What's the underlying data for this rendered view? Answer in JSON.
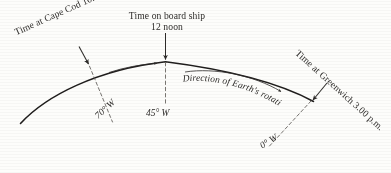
{
  "figure": {
    "type": "diagram",
    "background_color": "#fdfdfb",
    "ink_color": "#2d2b29"
  },
  "labels": {
    "cape_cod": {
      "line1": "Time at Cape Cod",
      "line2": "10.20 a.m.",
      "rotation_deg": -24
    },
    "on_board": {
      "line1": "Time on board ship",
      "line2": "12 noon",
      "rotation_deg": 0
    },
    "greenwich": {
      "line1": "Time at Greenwich",
      "line2": "3.00 p.m.",
      "rotation_deg": 42
    },
    "rotation_caption": {
      "text": "Direction of Earth's rotation"
    }
  },
  "meridians": [
    {
      "name": "meridian-70-west",
      "label": "70° W",
      "rotation_deg": -42
    },
    {
      "name": "meridian-45-west",
      "label": "45° W",
      "rotation_deg": 0
    },
    {
      "name": "meridian-0-west",
      "label": "0° W",
      "rotation_deg": -32
    }
  ],
  "arrows": {
    "cape_cod_pointer": "arrow pointing down-right to arc at 70 W",
    "on_board_pointer": "arrow pointing straight down to arc at 45 W",
    "greenwich_pointer": "arrow pointing down-left to arc at 0 W",
    "rotation_small_arrow": "short curved arrow pointing right, left of centre",
    "rotation_long_arrow": "long curved arrow pointing right, above the arc"
  }
}
